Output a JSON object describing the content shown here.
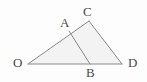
{
  "figure": {
    "type": "geometry-diagram",
    "background_color": "#fdfdfd",
    "stroke_color": "#8a8a8a",
    "fill_color": "#f3f3f3",
    "label_color": "#4a4a4a",
    "points": [
      {
        "name": "O",
        "label": "O",
        "x": 28,
        "y": 64,
        "label_x": 13,
        "label_y": 56,
        "on": "triangle-vertex"
      },
      {
        "name": "A",
        "label": "A",
        "x": 69,
        "y": 31,
        "label_x": 60,
        "label_y": 16,
        "on": "segment-OC"
      },
      {
        "name": "C",
        "label": "C",
        "x": 89,
        "y": 21,
        "label_x": 83,
        "label_y": 5,
        "on": "triangle-vertex"
      },
      {
        "name": "B",
        "label": "B",
        "x": 90,
        "y": 64,
        "label_x": 86,
        "label_y": 66,
        "on": "segment-OD"
      },
      {
        "name": "D",
        "label": "D",
        "x": 122,
        "y": 64,
        "label_x": 128,
        "label_y": 56,
        "on": "triangle-vertex"
      }
    ],
    "segments": [
      {
        "name": "segment-OC",
        "from": "O",
        "to": "C"
      },
      {
        "name": "segment-CD",
        "from": "C",
        "to": "D"
      },
      {
        "name": "segment-OD",
        "from": "O",
        "to": "D"
      },
      {
        "name": "segment-AB",
        "from": "A",
        "to": "B"
      }
    ],
    "polygons": [
      {
        "name": "triangle-OCD",
        "vertices": [
          "O",
          "C",
          "D"
        ]
      }
    ]
  }
}
